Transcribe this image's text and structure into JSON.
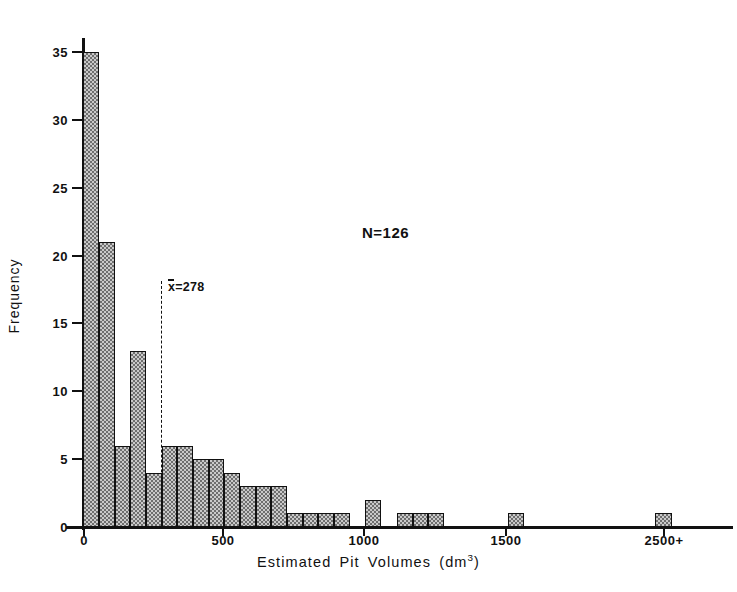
{
  "chart_data": {
    "type": "bar",
    "title": "",
    "xlabel": "Estimated Pit Volumes  (dm³)",
    "ylabel": "Frequency",
    "xlabel_main": "Estimated Pit Volumes",
    "xlabel_unit": "(dm",
    "xlabel_unit_sup": "3",
    "xlabel_unit_close": ")",
    "xlim": [
      0,
      2650
    ],
    "ylim": [
      0,
      35
    ],
    "grid": false,
    "legend": null,
    "bin_width": 56,
    "bar_fill": "#c9c9c9",
    "bar_edge": "#111111",
    "x_ticks": [
      {
        "value": 0,
        "label": "0",
        "px": 83
      },
      {
        "value": 500,
        "label": "500",
        "px": 222
      },
      {
        "value": 1000,
        "label": "1000",
        "px": 363
      },
      {
        "value": 1500,
        "label": "1500",
        "px": 505
      },
      {
        "value": 2500,
        "label": "2500+",
        "px": 663
      }
    ],
    "y_ticks": [
      {
        "value": 0,
        "label": "0"
      },
      {
        "value": 5,
        "label": "5"
      },
      {
        "value": 10,
        "label": "10"
      },
      {
        "value": 15,
        "label": "15"
      },
      {
        "value": 20,
        "label": "20"
      },
      {
        "value": 25,
        "label": "25"
      },
      {
        "value": 30,
        "label": "30"
      },
      {
        "value": 35,
        "label": "35"
      }
    ],
    "bars": [
      {
        "index": 0,
        "px_left": 83,
        "px_width": 16,
        "value": 35
      },
      {
        "index": 1,
        "px_left": 99,
        "px_width": 16,
        "value": 21
      },
      {
        "index": 2,
        "px_left": 115,
        "px_width": 15,
        "value": 6
      },
      {
        "index": 3,
        "px_left": 130,
        "px_width": 16,
        "value": 13
      },
      {
        "index": 4,
        "px_left": 146,
        "px_width": 16,
        "value": 4
      },
      {
        "index": 5,
        "px_left": 162,
        "px_width": 15,
        "value": 6
      },
      {
        "index": 6,
        "px_left": 177,
        "px_width": 16,
        "value": 6
      },
      {
        "index": 7,
        "px_left": 193,
        "px_width": 16,
        "value": 5
      },
      {
        "index": 8,
        "px_left": 209,
        "px_width": 15,
        "value": 5
      },
      {
        "index": 9,
        "px_left": 224,
        "px_width": 16,
        "value": 4
      },
      {
        "index": 10,
        "px_left": 240,
        "px_width": 16,
        "value": 3
      },
      {
        "index": 11,
        "px_left": 256,
        "px_width": 15,
        "value": 3
      },
      {
        "index": 12,
        "px_left": 271,
        "px_width": 16,
        "value": 3
      },
      {
        "index": 13,
        "px_left": 287,
        "px_width": 16,
        "value": 1
      },
      {
        "index": 14,
        "px_left": 303,
        "px_width": 15,
        "value": 1
      },
      {
        "index": 15,
        "px_left": 318,
        "px_width": 16,
        "value": 1
      },
      {
        "index": 16,
        "px_left": 334,
        "px_width": 16,
        "value": 1
      },
      {
        "index": 18,
        "px_left": 365,
        "px_width": 16,
        "value": 2
      },
      {
        "index": 20,
        "px_left": 397,
        "px_width": 16,
        "value": 1
      },
      {
        "index": 21,
        "px_left": 413,
        "px_width": 15,
        "value": 1
      },
      {
        "index": 22,
        "px_left": 428,
        "px_width": 16,
        "value": 1
      },
      {
        "index": 25,
        "px_left": 508,
        "px_width": 16,
        "value": 1
      },
      {
        "index": 33,
        "px_left": 655,
        "px_width": 17,
        "value": 1
      }
    ],
    "annotations": [
      {
        "name": "sample-size",
        "text": "N=126",
        "text_symbol": "N",
        "text_rest": "=126",
        "px_left": 362,
        "px_top": 224
      }
    ],
    "mean_line": {
      "label_symbol": "x",
      "label_rest": "=278",
      "label_full": "x̅=278",
      "value": 278,
      "px_x": 161,
      "px_top": 281,
      "px_bottom": 527,
      "style": "dashed"
    }
  }
}
